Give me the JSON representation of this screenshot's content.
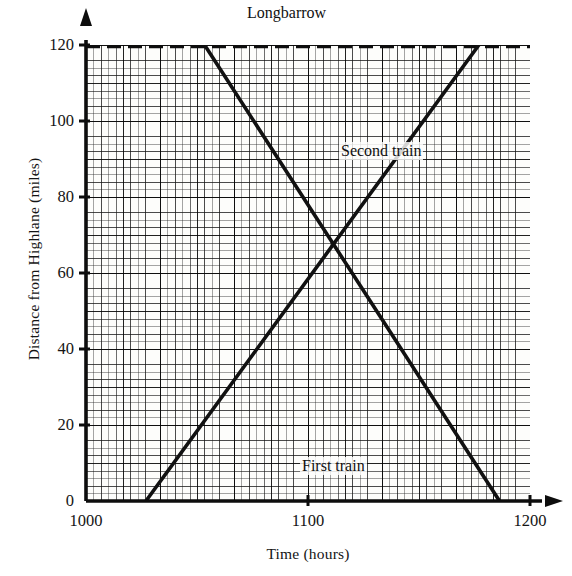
{
  "chart_data": {
    "type": "line",
    "title": "",
    "xlabel": "Time (hours)",
    "ylabel": "Distance from Highlane (miles)",
    "xlim": [
      1000,
      1200
    ],
    "ylim": [
      0,
      120
    ],
    "xticks": [
      1000,
      1100,
      1200
    ],
    "yticks": [
      0,
      20,
      40,
      60,
      80,
      100,
      120
    ],
    "grid": "graph-paper, fine 2-minute / 1-mile squares with heavier 10-mile lines",
    "legend": "none (series labelled inline on the plot)",
    "annotations": [
      {
        "text": "Longbarrow",
        "x": 1112,
        "y": 120,
        "note": "station label above upper dashed line"
      },
      {
        "text": "Highlane",
        "x": 1055,
        "y": 8,
        "note": "station label just above the x-axis"
      },
      {
        "text": "Second train",
        "x": 1075,
        "y": 106,
        "note": "inline series label"
      },
      {
        "text": "First train",
        "x": 1058,
        "y": 23,
        "note": "inline series label"
      }
    ],
    "reference_lines": [
      {
        "name": "Longbarrow",
        "style": "dashed",
        "y": 120
      }
    ],
    "series": [
      {
        "name": "First train",
        "style": "solid",
        "color": "#111111",
        "direction": "Highlane to Longbarrow",
        "points": [
          {
            "x": 1027,
            "y": 0
          },
          {
            "x": 1177,
            "y": 120
          }
        ]
      },
      {
        "name": "Second train",
        "style": "solid",
        "color": "#111111",
        "direction": "Longbarrow to Highlane",
        "points": [
          {
            "x": 1054,
            "y": 120
          },
          {
            "x": 1186,
            "y": 0
          }
        ]
      }
    ],
    "intersection": {
      "x": 1112,
      "y": 68,
      "note": "the two trains pass each other"
    }
  },
  "axes": {
    "y_title": "Distance from Highlane (miles)",
    "x_title": "Time (hours)",
    "y_tick_labels": [
      "120",
      "100",
      "80",
      "60",
      "40",
      "20",
      "0"
    ],
    "x_tick_labels": [
      "1000",
      "1100",
      "1200"
    ]
  },
  "labels": {
    "longbarrow": "Longbarrow",
    "highlane": "Highlane",
    "second_train": "Second train",
    "first_train": "First train"
  }
}
